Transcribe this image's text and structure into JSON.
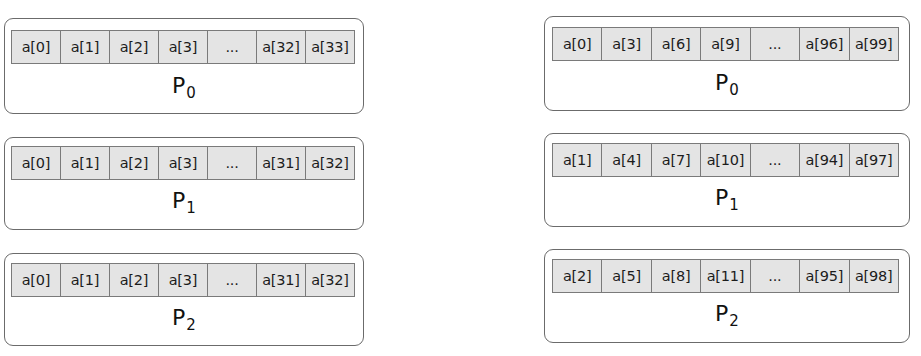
{
  "left_column": {
    "title": "Block distribution",
    "processors": [
      {
        "label": "P",
        "subscript": "0",
        "cells": [
          "a[0]",
          "a[1]",
          "a[2]",
          "a[3]",
          "...",
          "a[32]",
          "a[33]"
        ]
      },
      {
        "label": "P",
        "subscript": "1",
        "cells": [
          "a[0]",
          "a[1]",
          "a[2]",
          "a[3]",
          "...",
          "a[31]",
          "a[32]"
        ]
      },
      {
        "label": "P",
        "subscript": "2",
        "cells": [
          "a[0]",
          "a[1]",
          "a[2]",
          "a[3]",
          "...",
          "a[31]",
          "a[32]"
        ]
      }
    ]
  },
  "right_column": {
    "title": "Cyclic distribution",
    "processors": [
      {
        "label": "P",
        "subscript": "0",
        "cells": [
          "a[0]",
          "a[3]",
          "a[6]",
          "a[9]",
          "...",
          "a[96]",
          "a[99]"
        ]
      },
      {
        "label": "P",
        "subscript": "1",
        "cells": [
          "a[1]",
          "a[4]",
          "a[7]",
          "a[10]",
          "...",
          "a[94]",
          "a[97]"
        ]
      },
      {
        "label": "P",
        "subscript": "2",
        "cells": [
          "a[2]",
          "a[5]",
          "a[8]",
          "a[11]",
          "...",
          "a[95]",
          "a[98]"
        ]
      }
    ]
  },
  "colors": {
    "box_border": "#6b6b6b",
    "cell_fill": "#e4e4e4",
    "cell_border": "#7a7a7a",
    "background": "#ffffff"
  }
}
